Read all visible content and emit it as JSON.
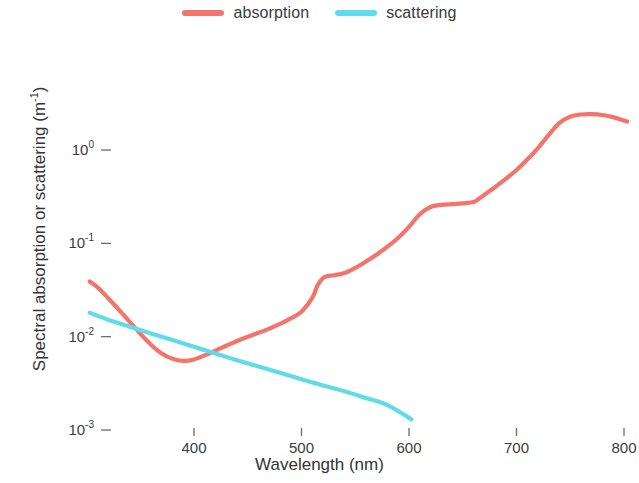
{
  "figure": {
    "background_color": "#ffffff",
    "text_color": "#3b3b3b"
  },
  "legend": {
    "position": "top-center",
    "entries": [
      {
        "label": "absorption",
        "color": "#f4736c",
        "swatch_name": "legend-swatch-absorption"
      },
      {
        "label": "scattering",
        "color": "#5fdce8",
        "swatch_name": "legend-swatch-scattering"
      }
    ]
  },
  "axes": {
    "x": {
      "title": "Wavelength (nm)",
      "scale": "linear",
      "limits": [
        303,
        812
      ],
      "ticks": [
        400,
        500,
        600,
        700,
        800
      ],
      "tick_labels": [
        "400",
        "500",
        "600",
        "700",
        "800"
      ]
    },
    "y": {
      "title": "Spectral absorption or scattering (m",
      "title_superscript": "-1",
      "title_suffix": ")",
      "title_full": "Spectral absorption or scattering (m^-1)",
      "scale": "log10",
      "limits": [
        0.00085,
        5.2
      ],
      "ticks": [
        1,
        0.1,
        0.01,
        0.001
      ],
      "tick_labels": [
        "10^0",
        "10^-1",
        "10^-2",
        "10^-3"
      ],
      "tick_mantissa": [
        "10",
        "10",
        "10",
        "10"
      ],
      "tick_exponents": [
        "0",
        "-1",
        "-2",
        "-3"
      ]
    }
  },
  "chart_data": {
    "type": "line",
    "title": "",
    "xlabel": "Wavelength (nm)",
    "ylabel": "Spectral absorption or scattering (m^-1)",
    "xlim": [
      303,
      812
    ],
    "ylim": [
      0.00085,
      5.2
    ],
    "yscale": "log",
    "grid": false,
    "legend_position": "top-center",
    "series": [
      {
        "name": "absorption",
        "color": "#f4736c",
        "line_width": 4.2,
        "x": [
          303,
          310,
          320,
          330,
          340,
          350,
          360,
          370,
          380,
          390,
          400,
          410,
          420,
          430,
          440,
          450,
          460,
          470,
          480,
          490,
          500,
          510,
          515,
          520,
          525,
          530,
          540,
          550,
          560,
          570,
          580,
          590,
          600,
          610,
          620,
          630,
          640,
          650,
          660,
          665,
          670,
          680,
          690,
          700,
          710,
          720,
          730,
          740,
          750,
          760,
          770,
          780,
          790,
          800,
          803
        ],
        "y": [
          0.039,
          0.034,
          0.026,
          0.0195,
          0.0145,
          0.0108,
          0.0082,
          0.0066,
          0.0058,
          0.0055,
          0.0057,
          0.0063,
          0.0071,
          0.008,
          0.009,
          0.01,
          0.011,
          0.0122,
          0.0137,
          0.0157,
          0.0185,
          0.026,
          0.0355,
          0.0425,
          0.0448,
          0.0455,
          0.048,
          0.0545,
          0.064,
          0.076,
          0.092,
          0.115,
          0.15,
          0.205,
          0.245,
          0.258,
          0.263,
          0.268,
          0.277,
          0.3,
          0.33,
          0.4,
          0.49,
          0.61,
          0.79,
          1.05,
          1.45,
          1.95,
          2.28,
          2.4,
          2.42,
          2.37,
          2.25,
          2.07,
          2.02
        ]
      },
      {
        "name": "scattering",
        "color": "#5fdce8",
        "line_width": 4.2,
        "x": [
          303,
          320,
          340,
          360,
          380,
          400,
          420,
          440,
          460,
          480,
          500,
          520,
          540,
          560,
          580,
          600,
          602
        ],
        "y": [
          0.018,
          0.0152,
          0.0128,
          0.0108,
          0.0092,
          0.0078,
          0.0066,
          0.0056,
          0.0048,
          0.0041,
          0.0035,
          0.003,
          0.0026,
          0.0022,
          0.00185,
          0.00135,
          0.0013
        ]
      }
    ]
  },
  "plot_geometry": {
    "x_pixel_at_400": 194,
    "x_pixel_at_800": 624,
    "y_pixel_at_1": 150,
    "y_pixel_at_0001": 430
  }
}
